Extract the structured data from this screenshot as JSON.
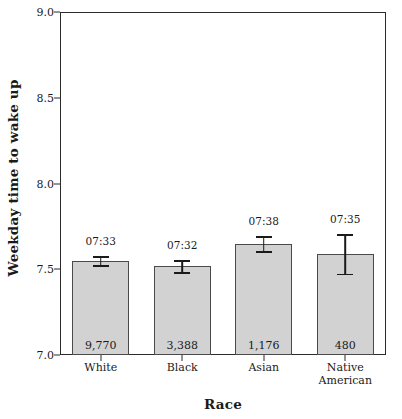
{
  "chart_data": {
    "type": "bar",
    "title": "",
    "xlabel": "Race",
    "ylabel": "Weekday time to wake up",
    "categories": [
      "White",
      "Black",
      "Asian",
      "Native American"
    ],
    "values": [
      7.55,
      7.52,
      7.65,
      7.59
    ],
    "errors": [
      0.025,
      0.035,
      0.045,
      0.115
    ],
    "value_labels": [
      "07:33",
      "07:32",
      "07:38",
      "07:35"
    ],
    "counts": [
      "9,770",
      "3,388",
      "1,176",
      "480"
    ],
    "ylim": [
      7.0,
      9.0
    ],
    "yticks": [
      7.0,
      7.5,
      8.0,
      8.5,
      9.0
    ],
    "ytick_labels": [
      "7.0",
      "7.5",
      "8.0",
      "8.5",
      "9.0"
    ],
    "grid": false,
    "legend": "none",
    "bar_color": "#d2d2d2",
    "bar_edge_color": "#4a4a4a",
    "error_color": "#1a1a1a",
    "axis_color": "#2b2b2b"
  },
  "axes": {
    "y_title": "Weekday time to wake up",
    "x_title": "Race"
  },
  "categories_display": [
    {
      "line1": "White",
      "line2": ""
    },
    {
      "line1": "Black",
      "line2": ""
    },
    {
      "line1": "Asian",
      "line2": ""
    },
    {
      "line1": "Native",
      "line2": "American"
    }
  ]
}
